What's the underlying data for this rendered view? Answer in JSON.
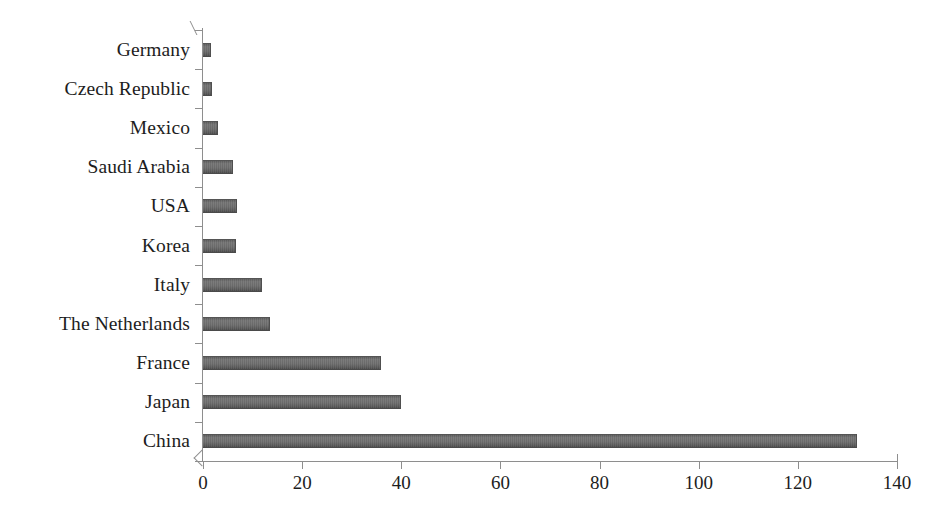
{
  "chart_data": {
    "type": "bar",
    "orientation": "horizontal",
    "title": "",
    "subtitle": "",
    "xlabel": "",
    "ylabel": "",
    "categories": [
      "Germany",
      "Czech Republic",
      "Mexico",
      "Saudi Arabia",
      "USA",
      "Korea",
      "Italy",
      "The Netherlands",
      "France",
      "Japan",
      "China"
    ],
    "values": [
      1.6,
      1.8,
      3.0,
      6.0,
      6.9,
      6.7,
      11.9,
      13.5,
      36.0,
      40.0,
      132.0
    ],
    "xlim": [
      0,
      140
    ],
    "xticks": [
      0,
      20,
      40,
      60,
      80,
      100,
      120,
      140
    ],
    "xtick_labels": [
      "0",
      "20",
      "40",
      "60",
      "80",
      "100",
      "120",
      "140"
    ],
    "grid": false,
    "legend": null,
    "bar_color": "#6b6b6b",
    "axis_color": "#8e8e8e",
    "background_color": "#ffffff"
  }
}
